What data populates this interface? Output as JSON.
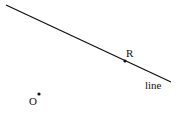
{
  "diagram": {
    "line": {
      "x1": 6,
      "y1": 5,
      "x2": 171,
      "y2": 82,
      "label": "line",
      "label_x": 145,
      "label_y": 89
    },
    "points": [
      {
        "name": "R",
        "x": 125,
        "y": 61,
        "label_x": 126,
        "label_y": 57
      },
      {
        "name": "O",
        "x": 39,
        "y": 94,
        "label_x": 29,
        "label_y": 105
      }
    ],
    "colors": {
      "stroke": "#111111",
      "background": "#ffffff"
    }
  }
}
